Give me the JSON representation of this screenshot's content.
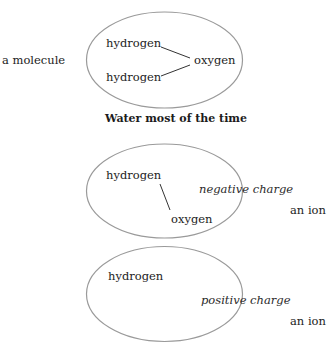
{
  "diagram": {
    "colors": {
      "ellipse_stroke": "#9a9a9a",
      "line_stroke": "#333333",
      "text": "#1c1c1c"
    },
    "water_molecule": {
      "side_label": "a molecule",
      "caption": "Water most of the time",
      "atoms": [
        "hydrogen",
        "hydrogen",
        "oxygen"
      ]
    },
    "hydroxide_ion": {
      "side_label": "an ion",
      "charge": "negative charge",
      "atoms": [
        "hydrogen",
        "oxygen"
      ]
    },
    "hydrogen_ion": {
      "side_label": "an ion",
      "charge": "positive charge",
      "atoms": [
        "hydrogen"
      ]
    }
  }
}
